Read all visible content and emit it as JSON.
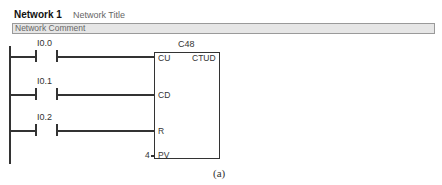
{
  "network": {
    "label": "Network 1",
    "title": "Network Title",
    "comment": "Network Comment"
  },
  "contacts": [
    {
      "address": "I0.0",
      "type": "normally-open"
    },
    {
      "address": "I0.1",
      "type": "normally-open"
    },
    {
      "address": "I0.2",
      "type": "normally-open"
    }
  ],
  "counter": {
    "name": "C48",
    "type": "CTUD",
    "pins": {
      "cu": "CU",
      "cd": "CD",
      "r": "R",
      "pv": "PV"
    },
    "pv_value": "4"
  },
  "caption": "(a)"
}
